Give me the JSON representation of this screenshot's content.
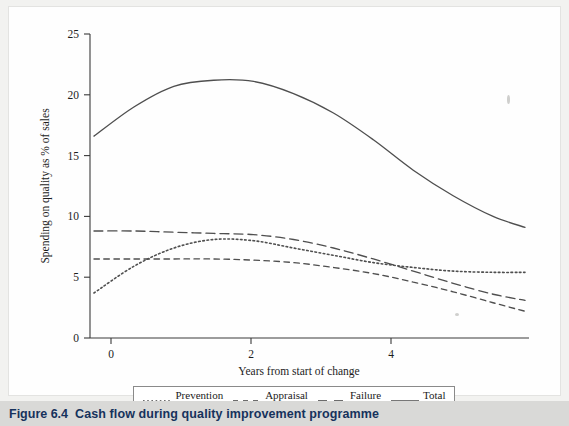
{
  "figure": {
    "caption_number": "Figure 6.4",
    "caption_title": "Cash flow during quality improvement programme"
  },
  "legend": {
    "entries": [
      {
        "label": "Prevention",
        "style": "dotted",
        "icon": "line-dotted-icon"
      },
      {
        "label": "Appraisal",
        "style": "dashed-short",
        "icon": "line-dashed-short-icon"
      },
      {
        "label": "Failure",
        "style": "dashed-long",
        "icon": "line-dashed-long-icon"
      },
      {
        "label": "Total",
        "style": "solid",
        "icon": "line-solid-icon"
      }
    ]
  },
  "chart_data": {
    "type": "line",
    "title": "Cash flow during quality improvement programme",
    "xlabel": "Years from start of change",
    "ylabel": "Spending on quality as % of sales",
    "xlim": [
      -0.05,
      5.45
    ],
    "ylim": [
      0,
      25
    ],
    "xticks": [
      0,
      2,
      4
    ],
    "xtick_labels": [
      "0",
      "2",
      "4"
    ],
    "yticks": [
      0,
      5,
      10,
      15,
      20,
      25
    ],
    "ytick_labels": [
      "0",
      "5",
      "10",
      "15",
      "20",
      "25"
    ],
    "grid": false,
    "legend_position": "below-axes",
    "x": [
      0,
      0.5,
      1,
      1.5,
      2,
      2.5,
      3,
      3.5,
      4,
      4.5,
      5,
      5.4
    ],
    "series": [
      {
        "name": "Prevention",
        "style": "dotted",
        "values": [
          3.7,
          5.9,
          7.4,
          8.1,
          8.0,
          7.4,
          6.8,
          6.2,
          5.8,
          5.5,
          5.4,
          5.4
        ]
      },
      {
        "name": "Appraisal",
        "style": "dashed-short",
        "values": [
          6.5,
          6.5,
          6.5,
          6.5,
          6.4,
          6.2,
          5.8,
          5.3,
          4.6,
          3.8,
          2.9,
          2.2
        ]
      },
      {
        "name": "Failure",
        "style": "dashed-long",
        "values": [
          8.8,
          8.8,
          8.7,
          8.6,
          8.5,
          8.1,
          7.4,
          6.5,
          5.5,
          4.5,
          3.6,
          3.1
        ]
      },
      {
        "name": "Total",
        "style": "solid",
        "values": [
          16.6,
          19.0,
          20.7,
          21.2,
          21.1,
          20.1,
          18.5,
          16.3,
          13.8,
          11.7,
          10.0,
          9.1
        ]
      }
    ]
  }
}
